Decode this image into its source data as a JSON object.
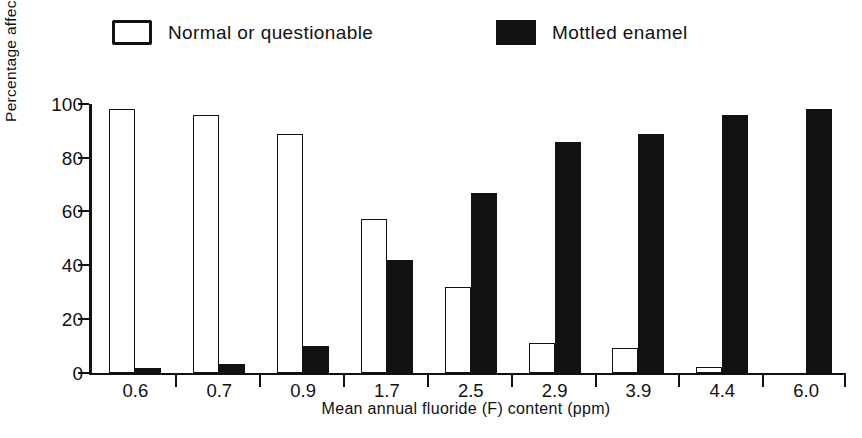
{
  "figure": {
    "legend": [
      {
        "key": "normal",
        "label": "Normal or questionable",
        "style": "open",
        "color": "#ffffff",
        "edge_color": "#111111"
      },
      {
        "key": "mottled",
        "label": "Mottled enamel",
        "style": "filled",
        "color": "#111111",
        "edge_color": "#111111"
      }
    ],
    "y_axis": {
      "label": "Percentage affected",
      "ticks": [
        "0",
        "20",
        "40",
        "60",
        "80",
        "100"
      ]
    },
    "x_axis": {
      "label": "Mean annual fluoride (F) content (ppm)"
    }
  },
  "chart_data": {
    "type": "bar",
    "title": "",
    "subtitle": "",
    "xlabel": "Mean annual fluoride (F) content (ppm)",
    "ylabel": "Percentage affected",
    "ylim": [
      0,
      100
    ],
    "yticks": [
      0,
      20,
      40,
      60,
      80,
      100
    ],
    "grid": false,
    "legend_position": "top",
    "categories": [
      "0.6",
      "0.7",
      "0.9",
      "1.7",
      "2.5",
      "2.9",
      "3.9",
      "4.4",
      "6.0"
    ],
    "series": [
      {
        "name": "Normal or questionable",
        "style": "open",
        "color": "#ffffff",
        "edge_color": "#111111",
        "values": [
          98,
          96,
          89,
          57,
          32,
          11,
          9,
          2,
          0
        ]
      },
      {
        "name": "Mottled enamel",
        "style": "filled",
        "color": "#111111",
        "edge_color": "#111111",
        "values": [
          1.5,
          3,
          10,
          42,
          67,
          86,
          89,
          96,
          98
        ]
      }
    ]
  }
}
